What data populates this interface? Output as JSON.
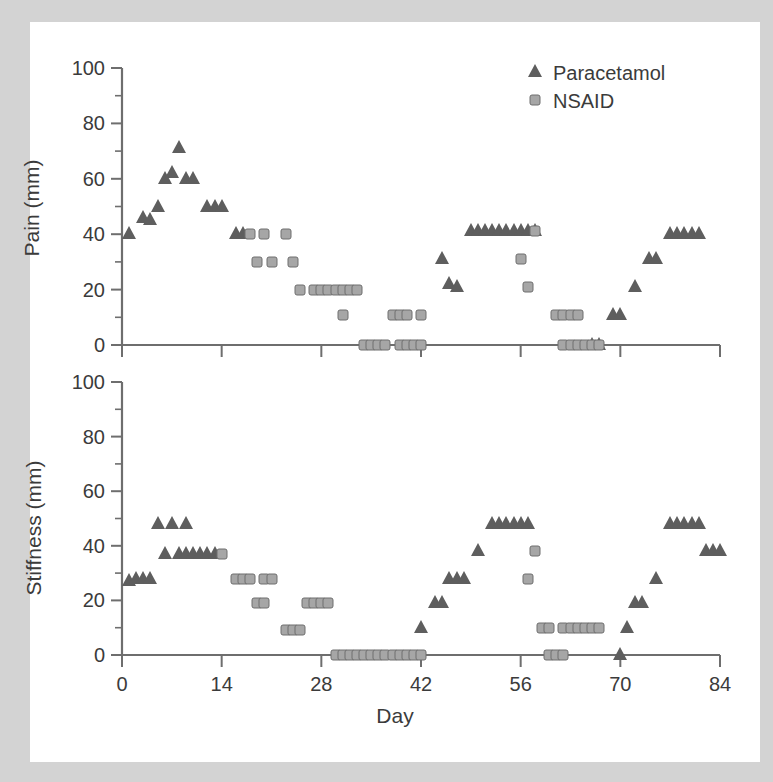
{
  "figure": {
    "background_color": "#d3d3d3",
    "paper_color": "#ffffff",
    "axis_color": "#6e6e6e",
    "text_color": "#3b3b3b"
  },
  "legend": {
    "position": "top-right",
    "entries": [
      {
        "label": "Paracetamol",
        "marker": "triangle",
        "color": "#5e5e5e"
      },
      {
        "label": "NSAID",
        "marker": "square",
        "color": "#a6a6a6"
      }
    ]
  },
  "axes": {
    "x": {
      "label": "Day",
      "min": 0,
      "max": 84,
      "ticks": [
        0,
        14,
        28,
        42,
        56,
        70,
        84
      ],
      "tick_labels": [
        "0",
        "14",
        "28",
        "42",
        "56",
        "70",
        "84"
      ]
    },
    "y": {
      "min": 0,
      "max": 100,
      "ticks": [
        0,
        20,
        40,
        60,
        80,
        100
      ],
      "tick_labels": [
        "0",
        "20",
        "40",
        "60",
        "80",
        "100"
      ],
      "minor_ticks": [
        10,
        30,
        50,
        70,
        90
      ]
    }
  },
  "chart_data": [
    {
      "type": "scatter",
      "title": "",
      "xlabel": "",
      "ylabel": "Pain (mm)",
      "xlim": [
        0,
        84
      ],
      "ylim": [
        0,
        100
      ],
      "grid": false,
      "legend_position": "top-right",
      "series": [
        {
          "name": "Paracetamol",
          "marker": "triangle",
          "color": "#5e5e5e",
          "points": [
            [
              1,
              40
            ],
            [
              3,
              46
            ],
            [
              4,
              45
            ],
            [
              5,
              50
            ],
            [
              6,
              60
            ],
            [
              7,
              62
            ],
            [
              8,
              71
            ],
            [
              9,
              60
            ],
            [
              10,
              60
            ],
            [
              12,
              50
            ],
            [
              13,
              50
            ],
            [
              14,
              50
            ],
            [
              16,
              40
            ],
            [
              17,
              40
            ],
            [
              45,
              31
            ],
            [
              46,
              22
            ],
            [
              47,
              21
            ],
            [
              49,
              41
            ],
            [
              50,
              41
            ],
            [
              51,
              41
            ],
            [
              52,
              41
            ],
            [
              53,
              41
            ],
            [
              54,
              41
            ],
            [
              55,
              41
            ],
            [
              56,
              41
            ],
            [
              57,
              41
            ],
            [
              58,
              41
            ],
            [
              66,
              0
            ],
            [
              67,
              0
            ],
            [
              69,
              11
            ],
            [
              70,
              11
            ],
            [
              72,
              21
            ],
            [
              74,
              31
            ],
            [
              75,
              31
            ],
            [
              77,
              40
            ],
            [
              78,
              40
            ],
            [
              79,
              40
            ],
            [
              80,
              40
            ],
            [
              81,
              40
            ]
          ]
        },
        {
          "name": "NSAID",
          "marker": "square",
          "color": "#a6a6a6",
          "points": [
            [
              18,
              40
            ],
            [
              20,
              40
            ],
            [
              23,
              40
            ],
            [
              19,
              30
            ],
            [
              21,
              30
            ],
            [
              24,
              30
            ],
            [
              25,
              20
            ],
            [
              27,
              20
            ],
            [
              28,
              20
            ],
            [
              29,
              20
            ],
            [
              30,
              20
            ],
            [
              31,
              20
            ],
            [
              32,
              20
            ],
            [
              33,
              20
            ],
            [
              31,
              11
            ],
            [
              34,
              0
            ],
            [
              35,
              0
            ],
            [
              36,
              0
            ],
            [
              37,
              0
            ],
            [
              38,
              11
            ],
            [
              39,
              11
            ],
            [
              40,
              11
            ],
            [
              39,
              0
            ],
            [
              40,
              0
            ],
            [
              41,
              0
            ],
            [
              42,
              11
            ],
            [
              42,
              0
            ],
            [
              58,
              41
            ],
            [
              56,
              31
            ],
            [
              57,
              21
            ],
            [
              61,
              11
            ],
            [
              62,
              11
            ],
            [
              63,
              11
            ],
            [
              64,
              11
            ],
            [
              62,
              0
            ],
            [
              63,
              0
            ],
            [
              64,
              0
            ],
            [
              65,
              0
            ],
            [
              66,
              0
            ],
            [
              67,
              0
            ]
          ]
        }
      ]
    },
    {
      "type": "scatter",
      "title": "",
      "xlabel": "Day",
      "ylabel": "Stiffness (mm)",
      "xlim": [
        0,
        84
      ],
      "ylim": [
        0,
        100
      ],
      "grid": false,
      "legend_position": "none",
      "series": [
        {
          "name": "Paracetamol",
          "marker": "triangle",
          "color": "#5e5e5e",
          "points": [
            [
              1,
              27
            ],
            [
              2,
              28
            ],
            [
              3,
              28
            ],
            [
              4,
              28
            ],
            [
              5,
              48
            ],
            [
              7,
              48
            ],
            [
              9,
              48
            ],
            [
              6,
              37
            ],
            [
              8,
              37
            ],
            [
              9,
              37
            ],
            [
              10,
              37
            ],
            [
              11,
              37
            ],
            [
              12,
              37
            ],
            [
              13,
              37
            ],
            [
              42,
              10
            ],
            [
              44,
              19
            ],
            [
              45,
              19
            ],
            [
              46,
              28
            ],
            [
              47,
              28
            ],
            [
              48,
              28
            ],
            [
              50,
              38
            ],
            [
              52,
              48
            ],
            [
              53,
              48
            ],
            [
              54,
              48
            ],
            [
              55,
              48
            ],
            [
              56,
              48
            ],
            [
              57,
              48
            ],
            [
              70,
              0
            ],
            [
              71,
              10
            ],
            [
              72,
              19
            ],
            [
              73,
              19
            ],
            [
              75,
              28
            ],
            [
              77,
              48
            ],
            [
              78,
              48
            ],
            [
              79,
              48
            ],
            [
              80,
              48
            ],
            [
              81,
              48
            ],
            [
              82,
              38
            ],
            [
              83,
              38
            ],
            [
              84,
              38
            ]
          ]
        },
        {
          "name": "NSAID",
          "marker": "square",
          "color": "#a6a6a6",
          "points": [
            [
              14,
              37
            ],
            [
              16,
              28
            ],
            [
              17,
              28
            ],
            [
              18,
              28
            ],
            [
              20,
              28
            ],
            [
              21,
              28
            ],
            [
              19,
              19
            ],
            [
              20,
              19
            ],
            [
              23,
              9
            ],
            [
              24,
              9
            ],
            [
              25,
              9
            ],
            [
              26,
              19
            ],
            [
              27,
              19
            ],
            [
              28,
              19
            ],
            [
              29,
              19
            ],
            [
              30,
              0
            ],
            [
              31,
              0
            ],
            [
              32,
              0
            ],
            [
              33,
              0
            ],
            [
              34,
              0
            ],
            [
              35,
              0
            ],
            [
              36,
              0
            ],
            [
              37,
              0
            ],
            [
              38,
              0
            ],
            [
              39,
              0
            ],
            [
              40,
              0
            ],
            [
              41,
              0
            ],
            [
              42,
              0
            ],
            [
              58,
              38
            ],
            [
              57,
              28
            ],
            [
              59,
              10
            ],
            [
              60,
              10
            ],
            [
              62,
              10
            ],
            [
              63,
              10
            ],
            [
              64,
              10
            ],
            [
              65,
              10
            ],
            [
              66,
              10
            ],
            [
              67,
              10
            ],
            [
              60,
              0
            ],
            [
              61,
              0
            ],
            [
              62,
              0
            ]
          ]
        }
      ]
    }
  ]
}
